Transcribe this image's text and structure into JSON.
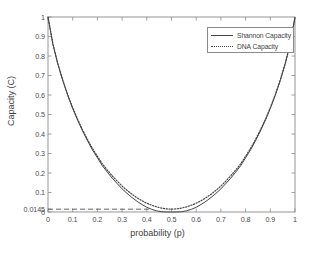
{
  "chart_data": {
    "type": "line",
    "title": "",
    "xlabel": "probability (p)",
    "ylabel": "Capacity (C)",
    "xlim": [
      0,
      1
    ],
    "ylim": [
      0,
      1
    ],
    "grid": false,
    "legend_position": "top-right",
    "xticks": [
      "0",
      "0.1",
      "0.2",
      "0.3",
      "0.4",
      "0.5",
      "0.6",
      "0.7",
      "0.8",
      "0.9",
      "1"
    ],
    "xtick_values": [
      0,
      0.1,
      0.2,
      0.3,
      0.4,
      0.5,
      0.6,
      0.7,
      0.8,
      0.9,
      1
    ],
    "yticks": [
      "0",
      "0.0145",
      "0.1",
      "0.2",
      "0.3",
      "0.4",
      "0.5",
      "0.6",
      "0.7",
      "0.8",
      "0.9",
      "1"
    ],
    "ytick_values": [
      0,
      0.0145,
      0.1,
      0.2,
      0.3,
      0.4,
      0.5,
      0.6,
      0.7,
      0.8,
      0.9,
      1
    ],
    "annotations": [
      {
        "name": "minimum-capacity-reference-line",
        "style": "dashed",
        "y": 0.0145,
        "x_start": 0,
        "x_end": 0.42,
        "label": "0.0145"
      }
    ],
    "x": [
      0,
      0.02,
      0.04,
      0.06,
      0.08,
      0.1,
      0.12,
      0.14,
      0.16,
      0.18,
      0.2,
      0.22,
      0.24,
      0.26,
      0.28,
      0.3,
      0.32,
      0.34,
      0.36,
      0.38,
      0.4,
      0.42,
      0.44,
      0.46,
      0.48,
      0.5,
      0.52,
      0.54,
      0.56,
      0.58,
      0.6,
      0.62,
      0.64,
      0.66,
      0.68,
      0.7,
      0.72,
      0.74,
      0.76,
      0.78,
      0.8,
      0.82,
      0.84,
      0.86,
      0.88,
      0.9,
      0.92,
      0.94,
      0.96,
      0.98,
      1
    ],
    "series": [
      {
        "name": "Shannon Capacity",
        "style": "solid",
        "color": "#444444",
        "values": [
          1.0,
          0.8586,
          0.7577,
          0.673,
          0.5978,
          0.531,
          0.4706,
          0.4156,
          0.365,
          0.3184,
          0.2781,
          0.2375,
          0.2045,
          0.1738,
          0.1457,
          0.1187,
          0.0955,
          0.0743,
          0.0553,
          0.0386,
          0.0242,
          0.0136,
          0.0058,
          0.0012,
          0.0,
          0.0,
          0.0,
          0.0012,
          0.0058,
          0.0136,
          0.0242,
          0.0386,
          0.0553,
          0.0743,
          0.0955,
          0.1187,
          0.1457,
          0.1738,
          0.2045,
          0.2375,
          0.2781,
          0.3184,
          0.365,
          0.4156,
          0.4706,
          0.531,
          0.5978,
          0.673,
          0.7577,
          0.8586,
          1.0
        ]
      },
      {
        "name": "DNA Capacity",
        "style": "dotted",
        "color": "#444444",
        "values": [
          1.0,
          0.86,
          0.76,
          0.676,
          0.601,
          0.535,
          0.475,
          0.421,
          0.3715,
          0.326,
          0.286,
          0.247,
          0.215,
          0.1855,
          0.1585,
          0.133,
          0.111,
          0.091,
          0.0735,
          0.058,
          0.045,
          0.0345,
          0.0262,
          0.02,
          0.016,
          0.0145,
          0.016,
          0.02,
          0.0262,
          0.0345,
          0.045,
          0.058,
          0.0735,
          0.091,
          0.111,
          0.133,
          0.1585,
          0.1855,
          0.215,
          0.247,
          0.286,
          0.326,
          0.3715,
          0.421,
          0.475,
          0.535,
          0.601,
          0.676,
          0.76,
          0.86,
          1.0
        ]
      }
    ]
  },
  "legend": {
    "items": [
      {
        "label": "Shannon Capacity",
        "style": "solid"
      },
      {
        "label": "DNA Capacity",
        "style": "dotted"
      }
    ]
  },
  "colors": {
    "background": "#ffffff",
    "axis": "#808080",
    "curve": "#444444",
    "text": "#3f3f3f"
  }
}
